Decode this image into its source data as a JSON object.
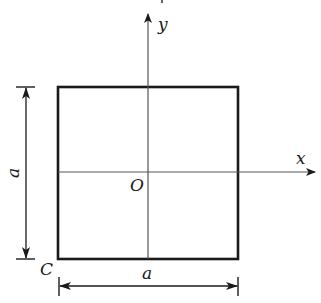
{
  "diagram": {
    "type": "square cross-section with coordinate axes",
    "colors": {
      "stroke": "#1a1a1a",
      "axis": "#555555",
      "background": "#ffffff"
    },
    "labels": {
      "y_axis": "y",
      "x_axis": "x",
      "origin": "O",
      "corner": "C",
      "side_vertical": "a",
      "side_horizontal": "a"
    },
    "square": {
      "x": 58,
      "y": 87,
      "width": 180,
      "height": 172
    },
    "axes": {
      "y": {
        "x": 148,
        "from_y": 259,
        "to_y": 13
      },
      "x": {
        "y": 172,
        "from_x": 58,
        "to_x": 316
      }
    }
  }
}
